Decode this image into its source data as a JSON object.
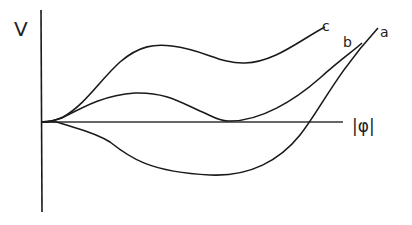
{
  "diagram": {
    "y_axis_label": "V",
    "x_axis_label": "|φ|",
    "curves": [
      {
        "id": "a",
        "label": "a",
        "description": "dips below zero, crosses axis near right"
      },
      {
        "id": "b",
        "label": "b",
        "description": "local max then touches axis at a second minimum, then rises"
      },
      {
        "id": "c",
        "label": "c",
        "description": "local max, shallow local min above zero, then rises"
      }
    ],
    "stroke_color": "#1a1a1a",
    "background": "#ffffff"
  }
}
